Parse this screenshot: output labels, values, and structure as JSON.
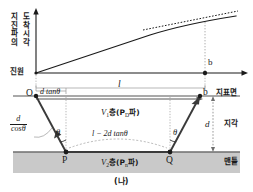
{
  "figure": {
    "caption": "(나)",
    "domain": "seismic-refraction-travel-time-diagram"
  },
  "graph": {
    "yaxis_label_column_left": "지진파의",
    "yaxis_label_column_right": "도착시각",
    "origin_label": "진원",
    "point_b_label": "b",
    "curve_note": "travel-time curve, solid, concave-down",
    "tangent_note": "dashed tangent line to far segment"
  },
  "section": {
    "point_o_label": "O",
    "point_b_label": "b",
    "point_p_label": "P",
    "point_q_label": "Q",
    "surface_label": "지표면",
    "crust_label": "지각",
    "mantle_label": "맨틀",
    "span_l_label": "l",
    "offset_label_num": "d",
    "offset_label_fn": "tan",
    "offset_label_theta": "θ",
    "offset_label_full": "d tanθ",
    "slant_numerator": "d",
    "slant_denominator": "cosθ",
    "angle_left_label": "θ",
    "angle_right_label": "θ",
    "depth_label": "d",
    "base_span_label": "l − 2d tanθ",
    "layer1_velocity": "V",
    "layer1_velocity_sub": "1",
    "layer1_text": "층(P",
    "layer1_phase_sub": "D",
    "layer1_text_end": "파)",
    "layer2_velocity": "V",
    "layer2_velocity_sub": "2",
    "layer2_text": "층(P",
    "layer2_phase_sub": "n",
    "layer2_text_end": "파)"
  },
  "colors": {
    "ink": "#1a1a1a",
    "guide": "#9a9a9a",
    "mantle_fill": "#c9c9c9",
    "interface": "#6e6e6e",
    "background": "#ffffff"
  }
}
